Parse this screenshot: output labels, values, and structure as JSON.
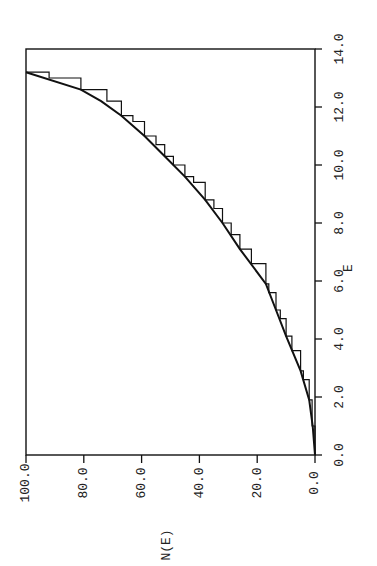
{
  "chart_data": {
    "type": "line",
    "orientation": "rotated-90-ccw",
    "title": "",
    "xlabel": "E",
    "ylabel": "N(E)",
    "xlim": [
      0,
      14
    ],
    "ylim": [
      0,
      100
    ],
    "x_ticks": [
      "0.0",
      "2.0",
      "4.0",
      "6.0",
      "8.0",
      "10.0",
      "12.0",
      "14.0"
    ],
    "y_ticks": [
      "0.0",
      "20.0",
      "40.0",
      "60.0",
      "80.0",
      "100.0"
    ],
    "grid": false,
    "legend": null,
    "series": [
      {
        "name": "smooth N(E)",
        "style": "solid",
        "x": [
          0.0,
          1.0,
          1.9,
          2.9,
          4.1,
          5.0,
          5.9,
          7.1,
          8.0,
          8.8,
          9.6,
          10.3,
          11.0,
          11.7,
          12.2,
          12.6,
          13.2
        ],
        "y": [
          0,
          0.8,
          2,
          5,
          10,
          13.5,
          17,
          26,
          32,
          38,
          45,
          52,
          59,
          67,
          74,
          81,
          100
        ]
      },
      {
        "name": "staircase N(E)",
        "style": "step",
        "x": [
          0.0,
          1.0,
          1.9,
          2.6,
          2.9,
          3.6,
          4.1,
          4.7,
          5.0,
          5.6,
          5.9,
          6.6,
          7.1,
          7.6,
          8.0,
          8.5,
          8.8,
          9.4,
          9.6,
          10.0,
          10.3,
          10.7,
          11.0,
          11.5,
          11.7,
          12.2,
          12.6,
          13.0,
          13.2
        ],
        "y": [
          0,
          1,
          2,
          4,
          5,
          8,
          10,
          12,
          13.5,
          16,
          17,
          22,
          26,
          29,
          32,
          35,
          38,
          42,
          45,
          49,
          52,
          55,
          59,
          63,
          67,
          72,
          81,
          92,
          100
        ]
      }
    ]
  },
  "labels": {
    "x_axis_title": "E",
    "y_axis_title": "N(E)"
  }
}
